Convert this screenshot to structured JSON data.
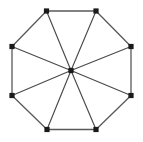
{
  "figure": {
    "name": "wheel-graph-w8",
    "width": 143,
    "height": 142,
    "background_color": "#ffffff"
  },
  "style": {
    "edge_color": "#4d4d4d",
    "rim_edge_color": "#595959",
    "spoke_edge_color": "#4a4a4a",
    "edge_width": 1.15,
    "rim_edge_width": 1.3,
    "node_color": "#1a1a1a",
    "node_size": 5.2,
    "node_shape": "square"
  },
  "chart_data": {
    "type": "diagram",
    "graph_type": "wheel",
    "node_count": 9,
    "edge_count": 16,
    "nodes": [
      {
        "id": "v1",
        "label": "",
        "x": 46.5,
        "y": 11.0,
        "role": "rim"
      },
      {
        "id": "v2",
        "label": "",
        "x": 96.0,
        "y": 11.0,
        "role": "rim"
      },
      {
        "id": "v3",
        "label": "",
        "x": 131.0,
        "y": 46.5,
        "role": "rim"
      },
      {
        "id": "v4",
        "label": "",
        "x": 131.0,
        "y": 95.5,
        "role": "rim"
      },
      {
        "id": "v5",
        "label": "",
        "x": 96.0,
        "y": 129.5,
        "role": "rim"
      },
      {
        "id": "v6",
        "label": "",
        "x": 47.0,
        "y": 129.5,
        "role": "rim"
      },
      {
        "id": "v7",
        "label": "",
        "x": 12.0,
        "y": 95.5,
        "role": "rim"
      },
      {
        "id": "v8",
        "label": "",
        "x": 12.0,
        "y": 46.5,
        "role": "rim"
      },
      {
        "id": "hub",
        "label": "",
        "x": 71.0,
        "y": 70.5,
        "role": "hub"
      }
    ],
    "edges": [
      {
        "from": "v1",
        "to": "v2",
        "kind": "rim"
      },
      {
        "from": "v2",
        "to": "v3",
        "kind": "rim"
      },
      {
        "from": "v3",
        "to": "v4",
        "kind": "rim"
      },
      {
        "from": "v4",
        "to": "v5",
        "kind": "rim"
      },
      {
        "from": "v5",
        "to": "v6",
        "kind": "rim"
      },
      {
        "from": "v6",
        "to": "v7",
        "kind": "rim"
      },
      {
        "from": "v7",
        "to": "v8",
        "kind": "rim"
      },
      {
        "from": "v8",
        "to": "v1",
        "kind": "rim"
      },
      {
        "from": "hub",
        "to": "v1",
        "kind": "spoke"
      },
      {
        "from": "hub",
        "to": "v2",
        "kind": "spoke"
      },
      {
        "from": "hub",
        "to": "v3",
        "kind": "spoke"
      },
      {
        "from": "hub",
        "to": "v4",
        "kind": "spoke"
      },
      {
        "from": "hub",
        "to": "v5",
        "kind": "spoke"
      },
      {
        "from": "hub",
        "to": "v6",
        "kind": "spoke"
      },
      {
        "from": "hub",
        "to": "v7",
        "kind": "spoke"
      },
      {
        "from": "hub",
        "to": "v8",
        "kind": "spoke"
      }
    ]
  }
}
